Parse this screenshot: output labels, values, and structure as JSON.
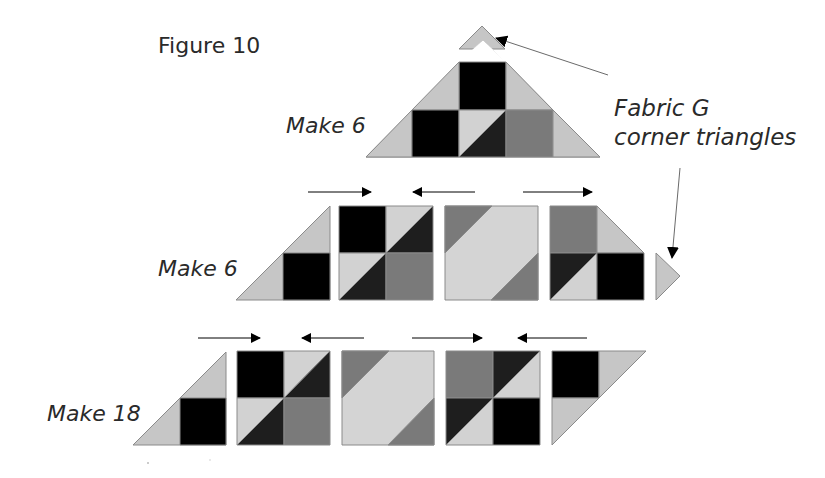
{
  "figure": {
    "title": "Figure 10",
    "callout": {
      "line1": "Fabric G",
      "line2": "corner triangles"
    },
    "rows": [
      {
        "id": "top",
        "label": "Make 6"
      },
      {
        "id": "middle",
        "label": "Make 6"
      },
      {
        "id": "bottom",
        "label": "Make 18"
      }
    ],
    "colors": {
      "light": "#c6c6c6",
      "lighter": "#d4d4d4",
      "medium": "#7a7a7a",
      "dark": "#1e1e1e",
      "black": "#000000",
      "outline": "#8a8a8a",
      "arrow": "#000000"
    }
  }
}
